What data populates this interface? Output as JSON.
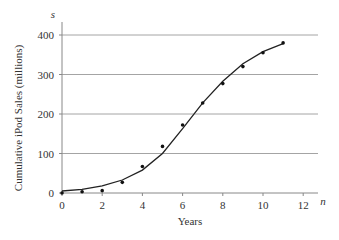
{
  "chart_data": {
    "type": "scatter",
    "title": "",
    "xlabel": "Years",
    "ylabel": "Cumulative iPod Sales (millions)",
    "x_axis_var": "n",
    "y_axis_var": "s",
    "xlim": [
      0,
      12.7
    ],
    "ylim": [
      0,
      420
    ],
    "xticks": [
      0,
      2,
      4,
      6,
      8,
      10,
      12
    ],
    "yticks": [
      0,
      100,
      200,
      300,
      400
    ],
    "grid": "horizontal",
    "series": [
      {
        "name": "data points",
        "style": "scatter",
        "x": [
          0,
          1,
          2,
          3,
          4,
          5,
          6,
          7,
          8,
          9,
          10,
          11
        ],
        "values": [
          0,
          3,
          6,
          27,
          67,
          118,
          172,
          228,
          277,
          320,
          355,
          380
        ]
      },
      {
        "name": "fitted curve",
        "style": "line",
        "x": [
          0,
          1,
          2,
          3,
          4,
          5,
          6,
          7,
          8,
          9,
          10,
          11
        ],
        "values": [
          5,
          9,
          18,
          33,
          58,
          100,
          163,
          228,
          283,
          327,
          358,
          378
        ]
      }
    ]
  }
}
